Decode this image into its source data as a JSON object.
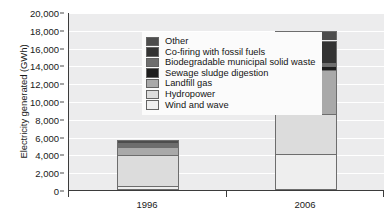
{
  "chart_data": {
    "type": "bar",
    "subtype": "stacked-bar",
    "title": "",
    "xlabel": "",
    "ylabel": "Electricity generated (GWh)",
    "categories": [
      "1996",
      "2006"
    ],
    "ylim": [
      0,
      20000
    ],
    "yticks": [
      0,
      2000,
      4000,
      6000,
      8000,
      10000,
      12000,
      14000,
      16000,
      18000,
      20000
    ],
    "ytick_labels": [
      "0",
      "2,000",
      "4,000",
      "6,000",
      "8,000",
      "10,000",
      "12,000",
      "14,000",
      "16,000",
      "18,000",
      "20,000"
    ],
    "grid": true,
    "grid_axis": "y",
    "legend_position": "upper-left-inside",
    "stack_order_bottom_to_top": [
      "Wind and wave",
      "Hydropower",
      "Landfill gas",
      "Sewage sludge digestion",
      "Biodegradable municipal solid waste",
      "Co-firing with fossil fuels",
      "Other"
    ],
    "series": [
      {
        "name": "Wind and wave",
        "color": "#eeeeee",
        "values": [
          450,
          4100
        ]
      },
      {
        "name": "Hydropower",
        "color": "#dcdcdc",
        "values": [
          3450,
          4450
        ]
      },
      {
        "name": "Landfill gas",
        "color": "#a9a9a9",
        "values": [
          900,
          4950
        ]
      },
      {
        "name": "Sewage sludge digestion",
        "color": "#1e1e1e",
        "values": [
          200,
          400
        ]
      },
      {
        "name": "Biodegradable municipal solid waste",
        "color": "#6e6e6e",
        "values": [
          150,
          350
        ]
      },
      {
        "name": "Co-firing with fossil fuels",
        "color": "#333333",
        "values": [
          100,
          2550
        ]
      },
      {
        "name": "Other",
        "color": "#4d4d4d",
        "values": [
          350,
          1050
        ]
      }
    ],
    "totals": [
      5600,
      17850
    ]
  },
  "legend": {
    "items": [
      {
        "label": "Other",
        "color": "#4d4d4d"
      },
      {
        "label": "Co-firing with fossil fuels",
        "color": "#333333"
      },
      {
        "label": "Biodegradable municipal solid waste",
        "color": "#6e6e6e"
      },
      {
        "label": "Sewage sludge digestion",
        "color": "#1e1e1e"
      },
      {
        "label": "Landfill gas",
        "color": "#a9a9a9"
      },
      {
        "label": "Hydropower",
        "color": "#dcdcdc"
      },
      {
        "label": "Wind and wave",
        "color": "#eeeeee"
      }
    ]
  }
}
